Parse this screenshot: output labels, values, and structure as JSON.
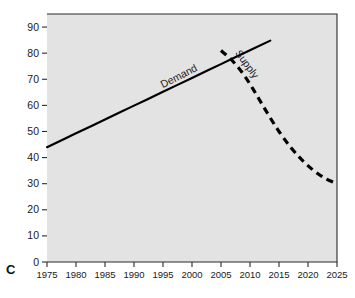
{
  "panel": {
    "label": "C"
  },
  "chart_data": {
    "type": "line",
    "title": "",
    "subtitle": "",
    "xlabel": "",
    "ylabel": "",
    "xlim": [
      1975,
      2025
    ],
    "ylim": [
      0,
      95
    ],
    "grid": false,
    "legend": "inline-labels",
    "background": "#e3e3e3",
    "x_ticks": [
      1975,
      1980,
      1985,
      1990,
      1995,
      2000,
      2005,
      2010,
      2015,
      2020,
      2025
    ],
    "x_tick_labels": [
      "1975",
      "1980",
      "1985",
      "1990",
      "1995",
      "2000",
      "2005",
      "2010",
      "2015",
      "2020",
      "2025"
    ],
    "y_ticks": [
      0,
      10,
      20,
      30,
      40,
      50,
      60,
      70,
      80,
      90
    ],
    "y_tick_labels": [
      "0",
      "10",
      "20",
      "30",
      "40",
      "50",
      "60",
      "70",
      "80",
      "90"
    ],
    "series": [
      {
        "name": "Demand",
        "style": "solid",
        "color": "#000000",
        "linewidth": 2.2,
        "label_text": "Demand",
        "label_x": 1998,
        "label_y": 70,
        "label_rotation": -27,
        "x": [
          1975,
          1980,
          1985,
          1990,
          1995,
          2000,
          2005,
          2010,
          2013.5
        ],
        "y": [
          44.0,
          49.3,
          54.6,
          59.9,
          65.2,
          70.5,
          75.8,
          81.1,
          84.8
        ]
      },
      {
        "name": "Supply",
        "style": "dashed",
        "color": "#000000",
        "linewidth": 3.2,
        "label_text": "Supply",
        "label_x": 2009,
        "label_y": 75,
        "label_rotation": 54,
        "x": [
          2005,
          2007,
          2009,
          2011,
          2013,
          2015,
          2017,
          2019,
          2021,
          2023,
          2025
        ],
        "y": [
          81.0,
          77.0,
          71.5,
          64.5,
          57.0,
          50.0,
          44.0,
          39.0,
          35.0,
          32.0,
          30.0
        ]
      }
    ]
  }
}
